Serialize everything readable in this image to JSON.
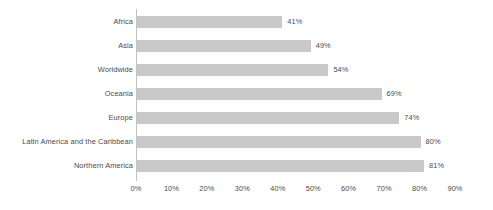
{
  "chart_data": {
    "type": "bar",
    "orientation": "horizontal",
    "title": "",
    "subtitle": "",
    "xlabel": "",
    "ylabel": "",
    "xlim": [
      0,
      90
    ],
    "grid": false,
    "legend": null,
    "categories": [
      "Africa",
      "Asia",
      "Worldwide",
      "Oceania",
      "Europe",
      "Latin America and the Caribbean",
      "Northern America"
    ],
    "values": [
      41,
      49,
      54,
      69,
      74,
      80,
      81
    ],
    "value_labels": [
      "41%",
      "49%",
      "54%",
      "69%",
      "74%",
      "80%",
      "81%"
    ],
    "xticks": [
      0,
      10,
      20,
      30,
      40,
      50,
      60,
      70,
      80,
      90
    ],
    "xtick_labels": [
      "0%",
      "10%",
      "20%",
      "30%",
      "40%",
      "50%",
      "60%",
      "70%",
      "80%",
      "90%"
    ],
    "bar_color": "#c9c9c9",
    "axis_color": "#c2c2c2",
    "text_color": "#4a4a4a",
    "background_color": "#ffffff"
  }
}
